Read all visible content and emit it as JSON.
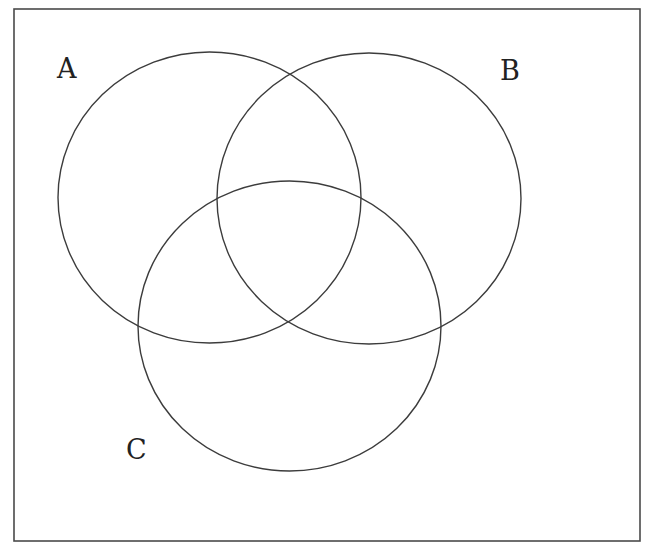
{
  "diagram": {
    "type": "venn",
    "title": "",
    "colors": {
      "background": "#ffffff",
      "stroke": "#3c3c3c",
      "label": "#222222"
    },
    "frame": {
      "x": 14,
      "y": 9,
      "width": 626,
      "height": 532
    },
    "sets": [
      {
        "id": "A",
        "label": "A",
        "cx": 209.5,
        "cy": 197.5,
        "rx": 151.5,
        "ry": 145.5,
        "label_x": 57,
        "label_y": 78
      },
      {
        "id": "B",
        "label": "B",
        "cx": 369,
        "cy": 198.5,
        "rx": 152,
        "ry": 145.5,
        "label_x": 500,
        "label_y": 80
      },
      {
        "id": "C",
        "label": "C",
        "cx": 289.5,
        "cy": 326,
        "rx": 151.5,
        "ry": 145,
        "label_x": 126,
        "label_y": 459
      }
    ]
  }
}
